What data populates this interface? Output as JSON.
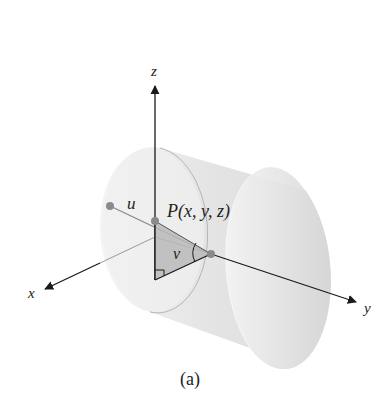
{
  "figure": {
    "caption": "(a)",
    "axes": {
      "x_label": "x",
      "y_label": "y",
      "z_label": "z"
    },
    "point_label": "P(x, y, z)",
    "parameter_labels": {
      "u": "u",
      "v": "v"
    },
    "colors": {
      "axis": "#1a1a1a",
      "cylinder_fill": "#d9d9d9",
      "cylinder_edge": "#b5b5b5",
      "triangle_fill": "#b8b8b8",
      "point": "#8a8a8a",
      "guide_line": "#9a9a9a"
    }
  }
}
